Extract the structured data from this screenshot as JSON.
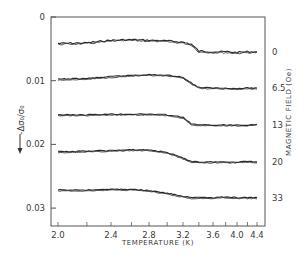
{
  "chart_data": {
    "type": "line",
    "title": "",
    "xlabel": "TEMPERATURE (K)",
    "ylabel": "-Δσ₀/σ₀",
    "right_label": "MAGNETIC FIELD (Oe)",
    "x_scale": "reciprocal (1/T)",
    "xlim": [
      2.0,
      4.45
    ],
    "ylim": [
      0,
      0.0327
    ],
    "y_inverted": true,
    "x_ticks": [
      "2.0",
      "2.4",
      "2.8",
      "3.2",
      "3.6",
      "4.0",
      "4.4"
    ],
    "y_ticks": [
      "0",
      "0.01",
      "0.02",
      "0.03"
    ],
    "grid": false,
    "legend": "series labeled at right edge",
    "series": [
      {
        "name": "0",
        "field_Oe": 0,
        "x": [
          2.0,
          2.2,
          2.4,
          2.6,
          2.8,
          3.0,
          3.2,
          3.3,
          3.4,
          3.6,
          3.8,
          4.0,
          4.2,
          4.4
        ],
        "y": [
          0.0042,
          0.0041,
          0.0037,
          0.0036,
          0.0037,
          0.0038,
          0.004,
          0.0043,
          0.0054,
          0.0055,
          0.0055,
          0.0056,
          0.0055,
          0.0055
        ]
      },
      {
        "name": "6.5",
        "field_Oe": 6.5,
        "x": [
          2.0,
          2.2,
          2.4,
          2.6,
          2.8,
          3.0,
          3.2,
          3.3,
          3.4,
          3.6,
          3.8,
          4.0,
          4.2,
          4.4
        ],
        "y": [
          0.0098,
          0.0097,
          0.0094,
          0.0092,
          0.0091,
          0.0092,
          0.0095,
          0.0104,
          0.0111,
          0.0112,
          0.0112,
          0.0113,
          0.0112,
          0.0112
        ]
      },
      {
        "name": "13",
        "field_Oe": 13,
        "x": [
          2.0,
          2.2,
          2.4,
          2.6,
          2.8,
          3.0,
          3.2,
          3.3,
          3.4,
          3.6,
          3.8,
          4.0,
          4.2,
          4.4
        ],
        "y": [
          0.0154,
          0.0154,
          0.0153,
          0.0153,
          0.0153,
          0.0154,
          0.0158,
          0.0168,
          0.017,
          0.017,
          0.017,
          0.017,
          0.017,
          0.0169
        ]
      },
      {
        "name": "20",
        "field_Oe": 20,
        "x": [
          2.0,
          2.2,
          2.4,
          2.6,
          2.8,
          3.0,
          3.2,
          3.3,
          3.4,
          3.6,
          3.8,
          4.0,
          4.2,
          4.4
        ],
        "y": [
          0.0212,
          0.0211,
          0.021,
          0.0209,
          0.0209,
          0.0213,
          0.0222,
          0.0227,
          0.0228,
          0.0228,
          0.0228,
          0.0228,
          0.0227,
          0.0228
        ]
      },
      {
        "name": "33",
        "field_Oe": 33,
        "x": [
          2.0,
          2.2,
          2.4,
          2.6,
          2.8,
          3.0,
          3.2,
          3.3,
          3.4,
          3.6,
          3.8,
          4.0,
          4.2,
          4.4
        ],
        "y": [
          0.0272,
          0.0272,
          0.0271,
          0.0271,
          0.0273,
          0.0277,
          0.0282,
          0.0284,
          0.0284,
          0.0284,
          0.0283,
          0.0284,
          0.0284,
          0.0284
        ]
      }
    ]
  },
  "layout": {
    "plot": {
      "left": 51,
      "right": 265,
      "top": 17,
      "bottom": 226
    },
    "y_px_per_unit": 6370,
    "x_tick_px": {
      "2.0": 58,
      "2.4": 111,
      "2.8": 149,
      "3.2": 183,
      "3.6": 213,
      "4.0": 237,
      "4.4": 257
    },
    "line_color": "#2a2a2a",
    "axis_color": "#555555"
  }
}
